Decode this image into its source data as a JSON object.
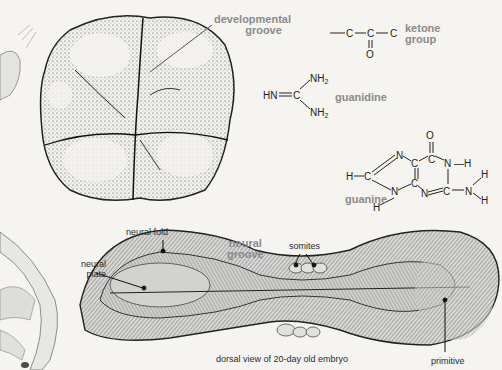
{
  "figures": {
    "tooth": {
      "label": "developmental groove",
      "label_line1": "developmental",
      "label_line2": "groove"
    },
    "ketone": {
      "formula_top": "—C—C—C",
      "formula_bottom": "O",
      "label_line1": "ketone",
      "label_line2": "group"
    },
    "guanidine": {
      "left": "HN═C",
      "nh2_top": "NH",
      "nh2_bottom": "NH",
      "subscript": "2",
      "label": "guanidine"
    },
    "guanine": {
      "label": "guanine",
      "atoms": {
        "O": "O",
        "N": "N",
        "C": "C",
        "H": "H"
      }
    },
    "embryo": {
      "caption": "dorsal view of 20-day old embryo",
      "labels": {
        "neural_fold": "neural fold",
        "neural_plate_line1": "neural",
        "neural_plate_line2": "plate",
        "neural_groove_line1": "neural",
        "neural_groove_line2": "groove",
        "somites": "somites",
        "primitive": "primitive"
      }
    }
  },
  "colors": {
    "background": "#f5f4f1",
    "label_gray": "#8a8a8a",
    "ink": "#2a2a2a"
  }
}
